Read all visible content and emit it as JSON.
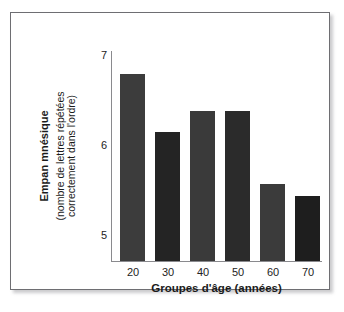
{
  "figure": {
    "frame_color": "#6e6e72",
    "background": "#ffffff"
  },
  "chart_data": {
    "type": "bar",
    "title": "",
    "xlabel": "Groupes d'âge (années)",
    "ylabel": "Empan mnésique",
    "ylabel_sub_line1": "(nombre de lettres répétées",
    "ylabel_sub_line2": "correctement dans l'ordre)",
    "categories": [
      "20",
      "30",
      "40",
      "50",
      "60",
      "70"
    ],
    "values": [
      6.8,
      6.15,
      6.39,
      6.39,
      5.57,
      5.44
    ],
    "bar_colors": [
      "#3c3c3c",
      "#242424",
      "#3a3a3a",
      "#2b2b2b",
      "#3b3b3b",
      "#1e1e1e"
    ],
    "ylim": [
      4.72,
      7.05
    ],
    "yticks": [
      5,
      6,
      7
    ],
    "ytick_labels": [
      "5",
      "6",
      "7"
    ],
    "xtick_labels": [
      "20",
      "30",
      "40",
      "50",
      "60",
      "70"
    ],
    "grid": false,
    "legend": null,
    "axis_color": "#8a8a8e"
  }
}
